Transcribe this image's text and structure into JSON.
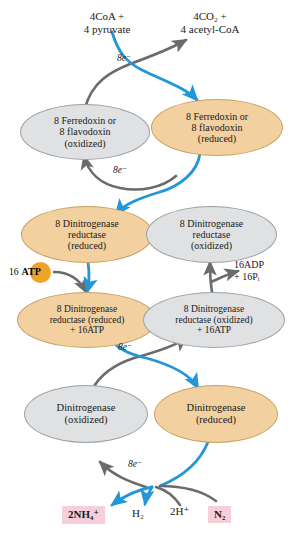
{
  "figure": {
    "colors": {
      "reduced_fill": "#f2d0a0",
      "reduced_stroke": "#c9a163",
      "oxidized_fill": "#dfe1e3",
      "oxidized_stroke": "#9aa0a5",
      "electron_arrow": "#2196d8",
      "gray_arrow": "#6b6b6b",
      "atp_disc": "#f0a32a",
      "product_box": "#f6cfdb"
    }
  },
  "substrates": {
    "left": {
      "line1": "4CoA +",
      "line2": "4 pyruvate"
    },
    "right": {
      "line1": "4CO₂ +",
      "line2": "4 acetyl-CoA"
    }
  },
  "nodes": {
    "ferredoxin_ox": {
      "line1": "8 Ferredoxin or",
      "line2": "8 flavodoxin",
      "line3": "(oxidized)",
      "state": "oxidized"
    },
    "ferredoxin_red": {
      "line1": "8 Ferredoxin or",
      "line2": "8 flavodoxin",
      "line3": "(reduced)",
      "state": "reduced"
    },
    "dinitrogenase_reductase_red": {
      "line1": "8 Dinitrogenase",
      "line2": "reductase",
      "line3": "(reduced)",
      "state": "reduced"
    },
    "dinitrogenase_reductase_ox": {
      "line1": "8 Dinitrogenase",
      "line2": "reductase",
      "line3": "(oxidized)",
      "state": "oxidized"
    },
    "dinitrogenase_reductase_red_atp": {
      "line1": "8 Dinitrogenase",
      "line2": "reductase (reduced)",
      "line3": "+ 16ATP",
      "state": "reduced"
    },
    "dinitrogenase_reductase_ox_atp": {
      "line1": "8 Dinitrogenase",
      "line2": "reductase (oxidized)",
      "line3": "+ 16ATP",
      "state": "oxidized"
    },
    "dinitrogenase_ox": {
      "line1": "Dinitrogenase",
      "line2": "(oxidized)",
      "state": "oxidized"
    },
    "dinitrogenase_red": {
      "line1": "Dinitrogenase",
      "line2": "(reduced)",
      "state": "reduced"
    }
  },
  "electron_labels": {
    "e1": "8e⁻",
    "e2": "8e⁻",
    "e3": "8e⁻",
    "e4": "8e⁻"
  },
  "energy": {
    "atp_count": "16",
    "atp_label": "ATP",
    "adp_line1": "16ADP",
    "adp_line2": "+ 16Pᵢ"
  },
  "products": {
    "ammonium": "2NH₄⁺",
    "hydrogen": "H₂",
    "proton": "2H⁺",
    "dinitrogen": "N₂"
  }
}
